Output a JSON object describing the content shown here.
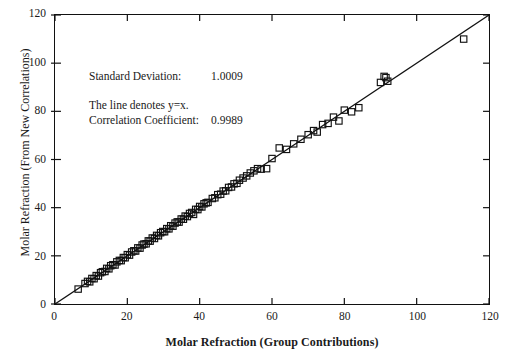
{
  "chart_data": {
    "type": "scatter",
    "title": "",
    "xlabel": "Molar Refraction (Group Contributions)",
    "ylabel": "Molar Refraction (From New Correlations)",
    "xlim": [
      0,
      120
    ],
    "ylim": [
      0,
      120
    ],
    "xticks": [
      0,
      20,
      40,
      60,
      80,
      100,
      120
    ],
    "yticks": [
      0,
      20,
      40,
      60,
      80,
      100,
      120
    ],
    "grid": false,
    "legend": null,
    "marker": "open-square",
    "marker_color": "#111111",
    "reference_line": {
      "label": "y=x",
      "from": [
        0,
        0
      ],
      "to": [
        120,
        120
      ],
      "color": "#111111"
    },
    "annotations": {
      "standard_deviation_label": "Standard Deviation:",
      "standard_deviation_value": "1.0009",
      "correlation_coefficient_label": "Correlation Coefficient:",
      "correlation_coefficient_value": "0.9989",
      "line_note": "The line denotes y=x."
    },
    "points": [
      [
        6.4,
        6.2
      ],
      [
        8.3,
        8.5
      ],
      [
        9.0,
        9.4
      ],
      [
        9.6,
        9.2
      ],
      [
        10.2,
        10.6
      ],
      [
        10.8,
        10.5
      ],
      [
        11.4,
        11.8
      ],
      [
        12.0,
        11.6
      ],
      [
        12.6,
        13.0
      ],
      [
        13.1,
        13.4
      ],
      [
        13.8,
        13.5
      ],
      [
        14.3,
        14.8
      ],
      [
        14.9,
        14.6
      ],
      [
        15.4,
        15.9
      ],
      [
        16.0,
        16.3
      ],
      [
        16.6,
        16.2
      ],
      [
        17.1,
        17.5
      ],
      [
        17.8,
        18.1
      ],
      [
        18.3,
        18.0
      ],
      [
        18.9,
        19.3
      ],
      [
        19.4,
        19.2
      ],
      [
        20.0,
        20.5
      ],
      [
        20.6,
        20.3
      ],
      [
        21.2,
        21.6
      ],
      [
        21.8,
        22.1
      ],
      [
        22.3,
        22.0
      ],
      [
        22.9,
        23.3
      ],
      [
        23.5,
        23.2
      ],
      [
        24.1,
        24.5
      ],
      [
        24.6,
        24.9
      ],
      [
        25.2,
        25.0
      ],
      [
        25.8,
        26.2
      ],
      [
        26.3,
        26.1
      ],
      [
        26.9,
        27.4
      ],
      [
        27.5,
        27.2
      ],
      [
        28.1,
        28.5
      ],
      [
        28.6,
        28.3
      ],
      [
        29.2,
        29.6
      ],
      [
        29.8,
        30.1
      ],
      [
        30.3,
        30.0
      ],
      [
        30.9,
        31.3
      ],
      [
        31.5,
        31.2
      ],
      [
        32.0,
        32.5
      ],
      [
        32.6,
        32.3
      ],
      [
        33.2,
        33.6
      ],
      [
        33.8,
        34.1
      ],
      [
        34.3,
        34.0
      ],
      [
        34.9,
        35.3
      ],
      [
        35.5,
        35.2
      ],
      [
        36.0,
        36.5
      ],
      [
        36.6,
        36.3
      ],
      [
        37.2,
        37.6
      ],
      [
        37.8,
        38.0
      ],
      [
        38.3,
        37.2
      ],
      [
        38.9,
        39.3
      ],
      [
        39.5,
        39.2
      ],
      [
        40.0,
        40.5
      ],
      [
        40.6,
        40.3
      ],
      [
        41.2,
        41.6
      ],
      [
        41.8,
        42.0
      ],
      [
        42.3,
        42.2
      ],
      [
        43.5,
        43.8
      ],
      [
        44.2,
        44.1
      ],
      [
        45.0,
        45.4
      ],
      [
        45.8,
        45.6
      ],
      [
        46.5,
        46.9
      ],
      [
        47.2,
        47.0
      ],
      [
        48.0,
        48.4
      ],
      [
        48.8,
        48.6
      ],
      [
        49.5,
        49.9
      ],
      [
        50.3,
        50.1
      ],
      [
        51.0,
        51.4
      ],
      [
        52.0,
        52.3
      ],
      [
        53.0,
        53.2
      ],
      [
        54.0,
        54.4
      ],
      [
        55.0,
        55.3
      ],
      [
        56.0,
        56.2
      ],
      [
        57.0,
        56.0
      ],
      [
        58.5,
        56.2
      ],
      [
        60.0,
        60.4
      ],
      [
        62.0,
        64.8
      ],
      [
        64.0,
        64.2
      ],
      [
        66.0,
        66.5
      ],
      [
        68.0,
        68.4
      ],
      [
        70.0,
        70.3
      ],
      [
        71.5,
        72.0
      ],
      [
        72.5,
        71.4
      ],
      [
        74.0,
        74.5
      ],
      [
        75.5,
        75.0
      ],
      [
        77.0,
        77.6
      ],
      [
        78.5,
        76.0
      ],
      [
        80.0,
        80.5
      ],
      [
        82.0,
        79.8
      ],
      [
        84.0,
        81.5
      ],
      [
        90.0,
        92.0
      ],
      [
        91.0,
        94.5
      ],
      [
        91.5,
        94.0
      ],
      [
        92.0,
        92.5
      ],
      [
        113.0,
        110.0
      ]
    ]
  }
}
